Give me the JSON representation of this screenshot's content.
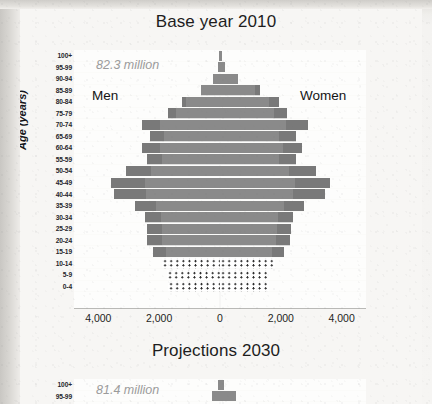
{
  "charts": [
    {
      "title": "Base year 2010",
      "total_label": "82.3 million",
      "men_label": "Men",
      "women_label": "Women"
    },
    {
      "title": "Projections 2030",
      "total_label": "81.4 million"
    }
  ],
  "axis": {
    "y_title": "Age (years)",
    "x_ticks": [
      "4,000",
      "2,000",
      "0",
      "2,000",
      "4,000"
    ],
    "age_groups": [
      "100+",
      "95-99",
      "90-94",
      "85-89",
      "80-84",
      "75-79",
      "70-74",
      "65-69",
      "60-64",
      "55-59",
      "50-54",
      "45-49",
      "40-44",
      "35-39",
      "30-34",
      "25-29",
      "20-24",
      "15-19",
      "10-14",
      "5-9",
      "0-4"
    ]
  },
  "colors": {
    "bar": "#8b8b8b",
    "bar_shade": "#6f6f6f",
    "total_text": "#9b9b9b",
    "text": "#1d1d1d",
    "plot_background": "#fdfdfc",
    "page_background": "#f7f6f4"
  },
  "chart_data": {
    "type": "bar",
    "title": "Base year 2010",
    "subtitle": "82.3 million",
    "xlabel": "",
    "ylabel": "Age (years)",
    "xlim": [
      -4800,
      4800
    ],
    "x_ticks": [
      -4000,
      -2000,
      0,
      2000,
      4000
    ],
    "x_tick_labels": [
      "4,000",
      "2,000",
      "0",
      "2,000",
      "4,000"
    ],
    "grid": false,
    "legend": "none",
    "orientation": "horizontal",
    "categories": [
      "100+",
      "95-99",
      "90-94",
      "85-89",
      "80-84",
      "75-79",
      "70-74",
      "65-69",
      "60-64",
      "55-59",
      "50-54",
      "45-49",
      "40-44",
      "35-39",
      "30-34",
      "25-29",
      "20-24",
      "15-19",
      "10-14",
      "5-9",
      "0-4"
    ],
    "units": "thousands of persons per five-year age group",
    "series": [
      {
        "name": "Men",
        "direction": "left",
        "values": [
          20,
          60,
          230,
          620,
          1250,
          1700,
          2550,
          2300,
          2550,
          2400,
          3100,
          3600,
          3500,
          2800,
          2450,
          2400,
          2400,
          2200,
          1900,
          1750,
          1700
        ]
      },
      {
        "name": "Women",
        "direction": "right",
        "values": [
          60,
          180,
          600,
          1300,
          1950,
          2200,
          2900,
          2500,
          2700,
          2500,
          3150,
          3600,
          3450,
          2750,
          2400,
          2350,
          2300,
          2100,
          1800,
          1650,
          1620
        ]
      }
    ],
    "styled_groups": [
      {
        "categories": [
          "10-14",
          "5-9",
          "0-4"
        ],
        "fill": "dotted"
      }
    ]
  },
  "chart_data_secondary": {
    "type": "bar",
    "title": "Projections 2030",
    "subtitle": "81.4 million",
    "ylabel": "Age (years)",
    "visible_categories": [
      "100+",
      "95-99"
    ],
    "note": "Only the top of the second pyramid is visible at the bottom edge of the screenshot.",
    "series": [
      {
        "name": "Men",
        "direction": "left",
        "values": [
          60,
          260
        ]
      },
      {
        "name": "Women",
        "direction": "right",
        "values": [
          140,
          520
        ]
      }
    ]
  }
}
